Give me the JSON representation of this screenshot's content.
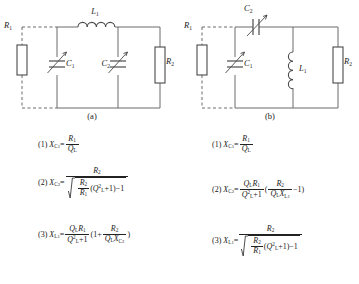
{
  "figure": {
    "panels": [
      {
        "id": "a",
        "caption": "(a)",
        "components": {
          "r1": "R",
          "r1_sub": "1",
          "r2": "R",
          "r2_sub": "2",
          "c1": "C",
          "c1_sub": "1",
          "c2": "C",
          "c2_sub": "2",
          "l1": "L",
          "l1_sub": "1"
        },
        "equations": [
          {
            "index": "(1)",
            "lhs": "X",
            "lhs_sub": "C1",
            "eq": "=",
            "numerator": "R1",
            "denominator": "QL",
            "form": "simple-fraction"
          },
          {
            "index": "(2)",
            "lhs": "X",
            "lhs_sub": "C2",
            "eq": "=",
            "numerator": "R2",
            "denominator": "sqrt( R2/R1 (Q_L^2 + 1) - 1 )",
            "form": "fraction-over-radical"
          },
          {
            "index": "(3)",
            "lhs": "X",
            "lhs_sub": "L1",
            "eq": "=",
            "expression": "Q_L R1 / (Q_L^2 + 1) ( 1 + R2 / (Q_L X_C2) )",
            "form": "fraction-times-paren"
          }
        ]
      },
      {
        "id": "b",
        "caption": "(b)",
        "components": {
          "r1": "R",
          "r1_sub": "1",
          "r2": "R",
          "r2_sub": "2",
          "c1": "C",
          "c1_sub": "1",
          "c2": "C",
          "c2_sub": "2",
          "l1": "L",
          "l1_sub": "1"
        },
        "equations": [
          {
            "index": "(1)",
            "lhs": "X",
            "lhs_sub": "C1",
            "eq": "=",
            "numerator": "R1",
            "denominator": "QL",
            "form": "simple-fraction"
          },
          {
            "index": "(2)",
            "lhs": "X",
            "lhs_sub": "C2",
            "eq": "=",
            "expression": "Q_L R1 / (Q_L^2 + 1) ( R2 / (Q_L X_L1) - 1 )",
            "form": "fraction-times-paren"
          },
          {
            "index": "(3)",
            "lhs": "X",
            "lhs_sub": "L1",
            "eq": "=",
            "numerator": "R2",
            "denominator": "sqrt( R2/R1 (Q_L^2 + 1) - 1 )",
            "form": "fraction-over-radical"
          }
        ]
      }
    ]
  },
  "symbols": {
    "X": "X",
    "R": "R",
    "Q": "Q",
    "L": "L",
    "C": "C",
    "one": "1",
    "two": "2",
    "sub_L": "L",
    "sub_C1": "C",
    "plus": "+",
    "minus": "−",
    "equals": "=",
    "lparen": "(",
    "rparen": ")",
    "paren_open": "(",
    "paren_close": ")"
  },
  "labels": {
    "eq1_index": "(1)",
    "eq2_index": "(2)",
    "eq3_index": "(3)",
    "caption_a": "(a)",
    "caption_b": "(b)"
  },
  "colors": {
    "wire": "#666666",
    "wire_dashed": "#8a8a8a",
    "text": "#1a1a1a",
    "background": "#ffffff"
  }
}
